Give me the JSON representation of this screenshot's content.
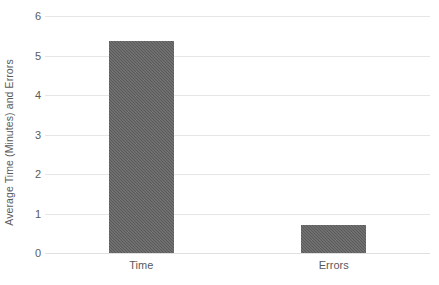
{
  "chart_data": {
    "type": "bar",
    "title": "",
    "subtitle": "",
    "xlabel": "",
    "ylabel": "Average Time (Minutes) and Errors",
    "categories": [
      "Time",
      "Errors"
    ],
    "values": [
      5.37,
      0.71
    ],
    "series": [
      {
        "name": "Average Time (Minutes) and Errors",
        "values": [
          5.37,
          0.71
        ]
      }
    ],
    "ylim": [
      0,
      6
    ],
    "ytick_values": [
      0,
      1,
      2,
      3,
      4,
      5,
      6
    ],
    "ytick_labels": [
      "0",
      "1",
      "2",
      "3",
      "4",
      "5",
      "6"
    ],
    "xtick_labels": [
      "Time",
      "Errors"
    ],
    "grid": {
      "horizontal": true,
      "vertical": false,
      "color": "#e6e6e6"
    },
    "legend": {
      "visible": false,
      "position": "none"
    },
    "colors": {
      "bar_fill": "#595959",
      "background": "#ffffff",
      "gridline": "#e6e6e6",
      "axis_line": "#e0e0e0",
      "text": "#5a5a5a"
    },
    "bar_style": "textured-dither"
  }
}
